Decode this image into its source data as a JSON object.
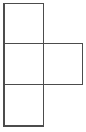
{
  "figure": {
    "kind": "line-drawing",
    "canvas": {
      "width": 86,
      "height": 132,
      "background": "#ffffff"
    },
    "style": {
      "stroke_color": "#4c4c4c",
      "stroke_width": 1.6,
      "fill_color": "none",
      "line_cap": "square",
      "line_join": "miter"
    },
    "geometry": {
      "cell_size": 40.5,
      "origin_x": 4,
      "origin_y": 3.5,
      "columns": 2,
      "rows": 3,
      "grid_x": [
        4,
        43.5,
        82.5
      ],
      "grid_y": [
        3.5,
        43.5,
        84.5,
        126
      ]
    },
    "squares": [
      {
        "id": "square-top-left",
        "label": "Top left square",
        "col": 0,
        "row": 0,
        "x": 4,
        "y": 3.5,
        "width": 39.5,
        "height": 40,
        "filled": false
      },
      {
        "id": "square-middle-left",
        "label": "Middle left square",
        "col": 0,
        "row": 1,
        "x": 4,
        "y": 43.5,
        "width": 39.5,
        "height": 41,
        "filled": false
      },
      {
        "id": "square-middle-right",
        "label": "Middle right square",
        "col": 1,
        "row": 1,
        "x": 43.5,
        "y": 43.5,
        "width": 39,
        "height": 41,
        "filled": false
      },
      {
        "id": "square-bottom-left",
        "label": "Bottom left square",
        "col": 0,
        "row": 2,
        "x": 4,
        "y": 84.5,
        "width": 39.5,
        "height": 41.5,
        "filled": false
      }
    ],
    "segments": [
      {
        "id": "seg-top-edge",
        "name": "top-edge",
        "orientation": "horizontal",
        "x1": 4,
        "y1": 3.5,
        "x2": 43.5,
        "y2": 3.5
      },
      {
        "id": "seg-upper-divider",
        "name": "upper-divider",
        "orientation": "horizontal",
        "x1": 4,
        "y1": 43.5,
        "x2": 82.5,
        "y2": 43.5
      },
      {
        "id": "seg-lower-divider",
        "name": "lower-divider",
        "orientation": "horizontal",
        "x1": 4,
        "y1": 84.5,
        "x2": 82.5,
        "y2": 84.5
      },
      {
        "id": "seg-bottom-edge",
        "name": "bottom-edge",
        "orientation": "horizontal",
        "x1": 4,
        "y1": 126,
        "x2": 43.5,
        "y2": 126
      },
      {
        "id": "seg-left-edge",
        "name": "left-edge",
        "orientation": "vertical",
        "x1": 4,
        "y1": 3.5,
        "x2": 4,
        "y2": 126
      },
      {
        "id": "seg-center-divider",
        "name": "center-divider",
        "orientation": "vertical",
        "x1": 43.5,
        "y1": 3.5,
        "x2": 43.5,
        "y2": 126
      },
      {
        "id": "seg-right-edge",
        "name": "right-edge",
        "orientation": "vertical",
        "x1": 82.5,
        "y1": 43.5,
        "x2": 82.5,
        "y2": 84.5
      }
    ],
    "labels": []
  }
}
